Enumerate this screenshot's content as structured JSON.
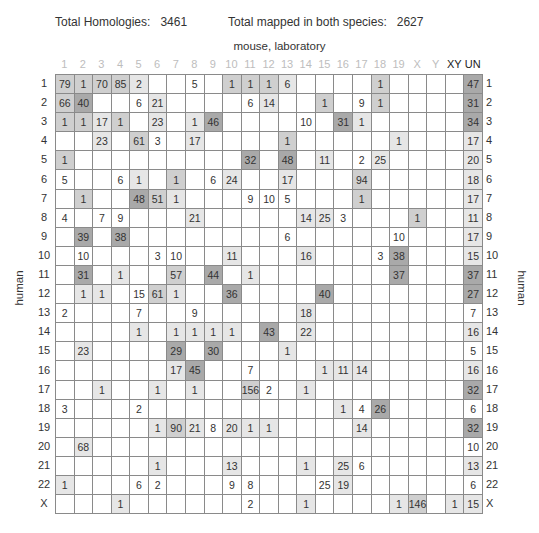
{
  "header": {
    "total_homologies_label": "Total Homologies:",
    "total_homologies_value": "3461",
    "total_mapped_label": "Total mapped in both species:",
    "total_mapped_value": "2627"
  },
  "x_axis_title": "mouse, laboratory",
  "y_axis_title": "human",
  "columns": [
    "1",
    "2",
    "3",
    "4",
    "5",
    "6",
    "7",
    "8",
    "9",
    "10",
    "11",
    "12",
    "13",
    "14",
    "15",
    "16",
    "17",
    "18",
    "19",
    "X",
    "Y",
    "XY",
    "UN"
  ],
  "rows": [
    "1",
    "2",
    "3",
    "4",
    "5",
    "6",
    "7",
    "8",
    "9",
    "10",
    "11",
    "12",
    "13",
    "14",
    "15",
    "16",
    "17",
    "18",
    "19",
    "20",
    "21",
    "22",
    "X"
  ],
  "colors": {
    "shade1": "#e6e6e6",
    "shade2": "#cfcfcf",
    "shade3": "#a9a9a9",
    "grid": "#8a8a8a",
    "faint_header": "#bdbdbd"
  },
  "chart_data": {
    "type": "table",
    "subtitle": "Total Homologies: 3461; Total mapped in both species: 2627",
    "xlabel": "mouse, laboratory",
    "ylabel": "human",
    "columns": [
      "1",
      "2",
      "3",
      "4",
      "5",
      "6",
      "7",
      "8",
      "9",
      "10",
      "11",
      "12",
      "13",
      "14",
      "15",
      "16",
      "17",
      "18",
      "19",
      "X",
      "Y",
      "XY",
      "UN"
    ],
    "rows": [
      "1",
      "2",
      "3",
      "4",
      "5",
      "6",
      "7",
      "8",
      "9",
      "10",
      "11",
      "12",
      "13",
      "14",
      "15",
      "16",
      "17",
      "18",
      "19",
      "20",
      "21",
      "22",
      "X"
    ],
    "cells_note": "each row: list of [column_index(1-based), value, shade_level 0-3]",
    "cells": [
      [
        [
          1,
          79,
          2
        ],
        [
          2,
          1,
          2
        ],
        [
          3,
          70,
          2
        ],
        [
          4,
          85,
          2
        ],
        [
          5,
          2,
          1
        ],
        [
          8,
          5,
          0
        ],
        [
          10,
          1,
          2
        ],
        [
          11,
          1,
          2
        ],
        [
          12,
          1,
          2
        ],
        [
          13,
          6,
          1
        ],
        [
          18,
          1,
          2
        ],
        [
          23,
          47,
          3
        ]
      ],
      [
        [
          1,
          66,
          2
        ],
        [
          2,
          40,
          3
        ],
        [
          5,
          6,
          0
        ],
        [
          6,
          21,
          1
        ],
        [
          11,
          6,
          0
        ],
        [
          12,
          14,
          1
        ],
        [
          15,
          1,
          2
        ],
        [
          17,
          9,
          0
        ],
        [
          18,
          1,
          2
        ],
        [
          23,
          31,
          3
        ]
      ],
      [
        [
          1,
          1,
          2
        ],
        [
          2,
          1,
          2
        ],
        [
          3,
          17,
          1
        ],
        [
          4,
          1,
          2
        ],
        [
          6,
          23,
          1
        ],
        [
          8,
          1,
          1
        ],
        [
          9,
          46,
          3
        ],
        [
          14,
          10,
          0
        ],
        [
          16,
          31,
          3
        ],
        [
          17,
          1,
          1
        ],
        [
          23,
          34,
          3
        ]
      ],
      [
        [
          3,
          23,
          1
        ],
        [
          5,
          61,
          2
        ],
        [
          6,
          3,
          0
        ],
        [
          8,
          17,
          1
        ],
        [
          13,
          1,
          2
        ],
        [
          19,
          1,
          1
        ],
        [
          23,
          17,
          1
        ]
      ],
      [
        [
          1,
          1,
          2
        ],
        [
          11,
          32,
          3
        ],
        [
          13,
          48,
          3
        ],
        [
          15,
          11,
          1
        ],
        [
          17,
          2,
          0
        ],
        [
          18,
          25,
          1
        ],
        [
          23,
          20,
          1
        ]
      ],
      [
        [
          1,
          5,
          0
        ],
        [
          4,
          6,
          0
        ],
        [
          5,
          1,
          1
        ],
        [
          7,
          1,
          2
        ],
        [
          9,
          6,
          0
        ],
        [
          10,
          24,
          1
        ],
        [
          13,
          17,
          1
        ],
        [
          17,
          94,
          2
        ],
        [
          23,
          18,
          1
        ]
      ],
      [
        [
          2,
          1,
          2
        ],
        [
          5,
          48,
          3
        ],
        [
          6,
          51,
          2
        ],
        [
          7,
          1,
          1
        ],
        [
          11,
          9,
          0
        ],
        [
          12,
          10,
          0
        ],
        [
          13,
          5,
          0
        ],
        [
          17,
          1,
          2
        ],
        [
          23,
          17,
          1
        ]
      ],
      [
        [
          1,
          4,
          0
        ],
        [
          3,
          7,
          0
        ],
        [
          4,
          9,
          0
        ],
        [
          8,
          21,
          1
        ],
        [
          14,
          14,
          1
        ],
        [
          15,
          25,
          1
        ],
        [
          16,
          3,
          0
        ],
        [
          20,
          1,
          2
        ],
        [
          23,
          11,
          1
        ]
      ],
      [
        [
          2,
          39,
          3
        ],
        [
          4,
          38,
          3
        ],
        [
          13,
          6,
          0
        ],
        [
          19,
          10,
          0
        ],
        [
          23,
          17,
          1
        ]
      ],
      [
        [
          2,
          10,
          0
        ],
        [
          6,
          3,
          0
        ],
        [
          7,
          10,
          0
        ],
        [
          10,
          11,
          1
        ],
        [
          14,
          16,
          1
        ],
        [
          18,
          3,
          0
        ],
        [
          19,
          38,
          3
        ],
        [
          23,
          15,
          1
        ]
      ],
      [
        [
          2,
          31,
          3
        ],
        [
          4,
          1,
          1
        ],
        [
          7,
          57,
          2
        ],
        [
          9,
          44,
          3
        ],
        [
          11,
          1,
          1
        ],
        [
          19,
          37,
          3
        ],
        [
          23,
          37,
          3
        ]
      ],
      [
        [
          2,
          1,
          1
        ],
        [
          3,
          1,
          1
        ],
        [
          5,
          15,
          0
        ],
        [
          6,
          61,
          2
        ],
        [
          7,
          1,
          1
        ],
        [
          10,
          36,
          3
        ],
        [
          15,
          40,
          3
        ],
        [
          23,
          27,
          3
        ]
      ],
      [
        [
          1,
          2,
          0
        ],
        [
          5,
          7,
          0
        ],
        [
          8,
          9,
          0
        ],
        [
          14,
          18,
          1
        ],
        [
          23,
          7,
          0
        ]
      ],
      [
        [
          5,
          1,
          1
        ],
        [
          7,
          1,
          1
        ],
        [
          8,
          1,
          1
        ],
        [
          9,
          1,
          1
        ],
        [
          10,
          1,
          1
        ],
        [
          12,
          43,
          3
        ],
        [
          14,
          22,
          1
        ],
        [
          23,
          16,
          1
        ]
      ],
      [
        [
          2,
          23,
          1
        ],
        [
          7,
          29,
          3
        ],
        [
          9,
          30,
          3
        ],
        [
          13,
          1,
          1
        ],
        [
          23,
          5,
          0
        ]
      ],
      [
        [
          7,
          17,
          1
        ],
        [
          8,
          45,
          3
        ],
        [
          11,
          7,
          0
        ],
        [
          15,
          1,
          1
        ],
        [
          16,
          11,
          1
        ],
        [
          17,
          14,
          1
        ],
        [
          23,
          16,
          1
        ]
      ],
      [
        [
          3,
          1,
          1
        ],
        [
          6,
          1,
          1
        ],
        [
          8,
          1,
          1
        ],
        [
          11,
          156,
          2
        ],
        [
          12,
          2,
          0
        ],
        [
          14,
          1,
          1
        ],
        [
          23,
          32,
          3
        ]
      ],
      [
        [
          1,
          3,
          0
        ],
        [
          5,
          2,
          0
        ],
        [
          16,
          1,
          1
        ],
        [
          17,
          4,
          0
        ],
        [
          18,
          26,
          3
        ],
        [
          23,
          6,
          0
        ]
      ],
      [
        [
          6,
          1,
          1
        ],
        [
          7,
          90,
          2
        ],
        [
          8,
          21,
          1
        ],
        [
          9,
          8,
          0
        ],
        [
          10,
          20,
          1
        ],
        [
          11,
          1,
          1
        ],
        [
          12,
          1,
          1
        ],
        [
          17,
          14,
          1
        ],
        [
          23,
          32,
          3
        ]
      ],
      [
        [
          2,
          68,
          1
        ],
        [
          23,
          10,
          0
        ]
      ],
      [
        [
          6,
          1,
          1
        ],
        [
          10,
          13,
          1
        ],
        [
          14,
          1,
          1
        ],
        [
          16,
          25,
          1
        ],
        [
          17,
          6,
          0
        ],
        [
          23,
          13,
          1
        ]
      ],
      [
        [
          1,
          1,
          1
        ],
        [
          5,
          6,
          0
        ],
        [
          6,
          2,
          0
        ],
        [
          10,
          9,
          0
        ],
        [
          11,
          8,
          0
        ],
        [
          15,
          25,
          0
        ],
        [
          16,
          19,
          1
        ],
        [
          23,
          6,
          0
        ]
      ],
      [
        [
          4,
          1,
          1
        ],
        [
          11,
          2,
          0
        ],
        [
          14,
          1,
          1
        ],
        [
          19,
          1,
          1
        ],
        [
          20,
          146,
          2
        ],
        [
          22,
          1,
          1
        ],
        [
          23,
          15,
          1
        ]
      ]
    ]
  }
}
